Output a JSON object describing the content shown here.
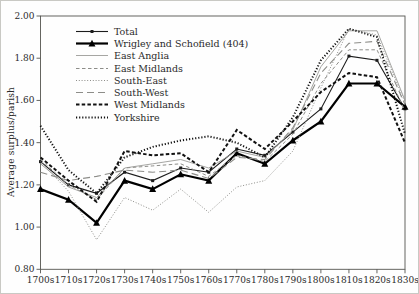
{
  "figure": {
    "title": "",
    "y_axis": {
      "label": "Average surplus/parish",
      "ticks": [
        "0.80",
        "1.00",
        "1.20",
        "1.40",
        "1.60",
        "1.80",
        "2.00"
      ],
      "min": 0.8,
      "max": 2.0
    },
    "x_axis": {
      "label": "",
      "ticks": [
        "1700s",
        "1710s",
        "1720s",
        "1730s",
        "1740s",
        "1750s",
        "1760s",
        "1770s",
        "1780s",
        "1790s",
        "1800s",
        "1810s",
        "1820s",
        "1830s"
      ]
    }
  },
  "chart_data": {
    "type": "line",
    "title": "",
    "xlabel": "",
    "ylabel": "Average surplus/parish",
    "ylim": [
      0.8,
      2.0
    ],
    "ytick_step": 0.2,
    "grid": false,
    "legend_position": "top-left-inside",
    "frame_color": "#555550",
    "categories": [
      "1700s",
      "1710s",
      "1720s",
      "1730s",
      "1740s",
      "1750s",
      "1760s",
      "1770s",
      "1780s",
      "1790s",
      "1800s",
      "1810s",
      "1820s",
      "1830s"
    ],
    "series": [
      {
        "name": "Total",
        "values": [
          1.31,
          1.2,
          1.16,
          1.26,
          1.22,
          1.28,
          1.26,
          1.37,
          1.34,
          1.45,
          1.56,
          1.81,
          1.79,
          1.56
        ],
        "color": "#1c1c1c",
        "dash": "",
        "width": 1.1,
        "marker": "square"
      },
      {
        "name": "Wrigley and Schofield (404)",
        "values": [
          1.18,
          1.13,
          1.02,
          1.22,
          1.18,
          1.25,
          1.22,
          1.35,
          1.3,
          1.41,
          1.5,
          1.68,
          1.68,
          1.57
        ],
        "color": "#000000",
        "dash": "",
        "width": 2.2,
        "marker": "triangle"
      },
      {
        "name": "East Anglia",
        "values": [
          1.3,
          1.19,
          1.14,
          1.28,
          1.3,
          1.32,
          1.28,
          1.36,
          1.33,
          1.46,
          1.76,
          1.93,
          1.93,
          1.6
        ],
        "color": "#9c9c98",
        "dash": "",
        "width": 0.9,
        "marker": ""
      },
      {
        "name": "East Midlands",
        "values": [
          1.32,
          1.2,
          1.13,
          1.28,
          1.29,
          1.3,
          1.24,
          1.34,
          1.31,
          1.44,
          1.68,
          1.84,
          1.84,
          1.55
        ],
        "color": "#8d8d89",
        "dash": "3.5,2.5",
        "width": 1.0,
        "marker": ""
      },
      {
        "name": "South-East",
        "values": [
          1.31,
          1.17,
          0.94,
          1.14,
          1.08,
          1.18,
          1.07,
          1.19,
          1.22,
          1.36,
          1.66,
          1.94,
          1.91,
          1.59
        ],
        "color": "#8d8d89",
        "dash": "1,1.8",
        "width": 1.0,
        "marker": ""
      },
      {
        "name": "South-West",
        "values": [
          1.26,
          1.22,
          1.24,
          1.27,
          1.26,
          1.27,
          1.23,
          1.33,
          1.32,
          1.47,
          1.73,
          1.87,
          1.88,
          1.58
        ],
        "color": "#8d8d89",
        "dash": "7,4",
        "width": 1.1,
        "marker": ""
      },
      {
        "name": "West Midlands",
        "values": [
          1.33,
          1.22,
          1.12,
          1.36,
          1.34,
          1.35,
          1.26,
          1.46,
          1.37,
          1.5,
          1.64,
          1.73,
          1.71,
          1.4
        ],
        "color": "#111111",
        "dash": "3.5,2.2",
        "width": 2.0,
        "marker": ""
      },
      {
        "name": "Yorkshire",
        "values": [
          1.48,
          1.27,
          1.16,
          1.33,
          1.38,
          1.41,
          1.43,
          1.4,
          1.33,
          1.52,
          1.79,
          1.94,
          1.9,
          1.44
        ],
        "color": "#111111",
        "dash": "1.2,1.9",
        "width": 2.0,
        "marker": ""
      }
    ]
  }
}
